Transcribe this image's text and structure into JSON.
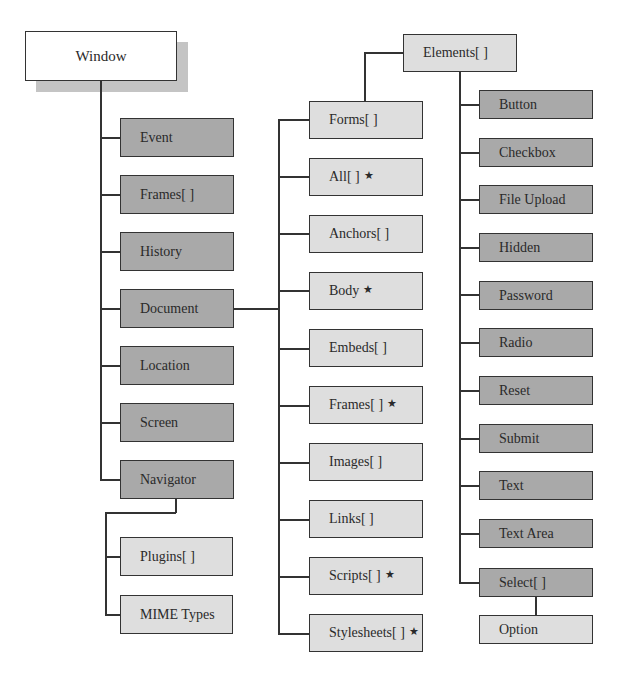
{
  "diagram": {
    "root": {
      "label": "Window"
    },
    "window_children": [
      {
        "label": "Event"
      },
      {
        "label": "Frames[ ]"
      },
      {
        "label": "History"
      },
      {
        "label": "Document"
      },
      {
        "label": "Location"
      },
      {
        "label": "Screen"
      },
      {
        "label": "Navigator"
      }
    ],
    "navigator_children": [
      {
        "label": "Plugins[ ]"
      },
      {
        "label": "MIME Types"
      }
    ],
    "document_children": [
      {
        "label": "Forms[ ]",
        "star": ""
      },
      {
        "label": "All[ ]",
        "star": "★"
      },
      {
        "label": "Anchors[ ]",
        "star": ""
      },
      {
        "label": "Body",
        "star": "★"
      },
      {
        "label": "Embeds[ ]",
        "star": ""
      },
      {
        "label": "Frames[ ]",
        "star": "★"
      },
      {
        "label": "Images[ ]",
        "star": ""
      },
      {
        "label": "Links[ ]",
        "star": ""
      },
      {
        "label": "Scripts[ ]",
        "star": "★"
      },
      {
        "label": "Stylesheets[ ]",
        "star": "★"
      }
    ],
    "forms_child": {
      "label": "Elements[ ]"
    },
    "elements_children": [
      {
        "label": "Button"
      },
      {
        "label": "Checkbox"
      },
      {
        "label": "File Upload"
      },
      {
        "label": "Hidden"
      },
      {
        "label": "Password"
      },
      {
        "label": "Radio"
      },
      {
        "label": "Reset"
      },
      {
        "label": "Submit"
      },
      {
        "label": "Text"
      },
      {
        "label": "Text Area"
      },
      {
        "label": "Select[ ]"
      }
    ],
    "select_child": {
      "label": "Option"
    },
    "colors": {
      "dark_box": "#a9a9a9",
      "light_box": "#dedede",
      "root_box": "#ffffff",
      "shadow": "#c4c4c4",
      "line": "#333333"
    }
  }
}
